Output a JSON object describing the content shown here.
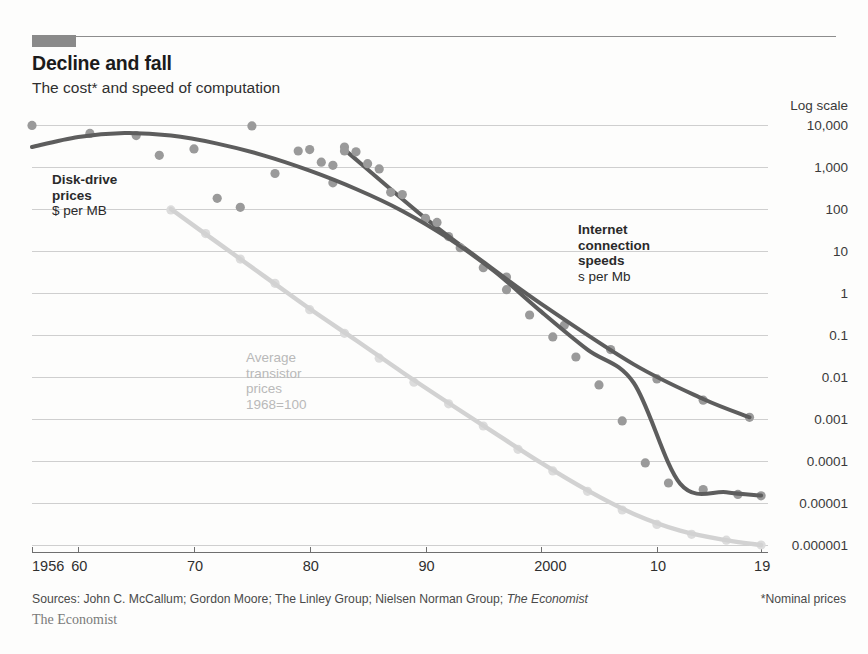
{
  "header": {
    "title": "Decline and fall",
    "subtitle": "The cost* and speed of computation",
    "accent_color": "#8a8a8a"
  },
  "footer": {
    "sources": "Sources: John C. McCallum; Gordon Moore; The Linley Group; Nielsen Norman Group; ",
    "sources_italic": "The Economist",
    "footnote": "*Nominal prices",
    "brand": "The Economist"
  },
  "annotations": {
    "disk": {
      "head": "Disk-drive\nprices",
      "head_line1": "Disk-drive",
      "head_line2": "prices",
      "unit": "$ per MB"
    },
    "internet": {
      "head_line1": "Internet",
      "head_line2": "connection",
      "head_line3": "speeds",
      "unit": "s per Mb"
    },
    "transistor": {
      "line1": "Average",
      "line2": "transistor",
      "line3": "prices",
      "line4": "1968=100"
    }
  },
  "chart_data": {
    "type": "line",
    "title": "Decline and fall",
    "subtitle": "The cost* and speed of computation",
    "xlabel": "",
    "ylabel": "",
    "scale_label": "Log scale",
    "y_axis_type": "log",
    "ylim": [
      1e-06,
      10000
    ],
    "y_ticks": [
      10000,
      1000,
      100,
      10,
      1,
      0.1,
      0.01,
      0.001,
      0.0001,
      1e-05,
      1e-06
    ],
    "y_tick_labels": [
      "10,000",
      "1,000",
      "100",
      "10",
      "1",
      "0.1",
      "0.01",
      "0.001",
      "0.0001",
      "0.00001",
      "0.000001"
    ],
    "xlim": [
      1956,
      1919
    ],
    "x_ticks": [
      1956,
      1960,
      1970,
      1980,
      1990,
      2000,
      2010,
      2019
    ],
    "x_tick_labels": [
      "1956",
      "60",
      "70",
      "80",
      "90",
      "2000",
      "10",
      "19"
    ],
    "grid": true,
    "legend_position": "inline-annotations",
    "series": [
      {
        "name": "Disk-drive prices",
        "unit": "$ per MB",
        "color": "#5d5d5d",
        "point_color": "#9a9a9a",
        "trend": [
          [
            1956,
            3000
          ],
          [
            1960,
            5200
          ],
          [
            1964,
            6400
          ],
          [
            1968,
            5600
          ],
          [
            1972,
            3600
          ],
          [
            1976,
            1900
          ],
          [
            1980,
            820
          ],
          [
            1984,
            300
          ],
          [
            1988,
            90
          ],
          [
            1992,
            20
          ],
          [
            1996,
            3.2
          ],
          [
            2000,
            0.36
          ],
          [
            2004,
            0.045
          ],
          [
            2008,
            0.0072
          ],
          [
            2012,
            2.9e-05
          ],
          [
            2016,
            1.8e-05
          ],
          [
            2019,
            1.5e-05
          ]
        ],
        "points": [
          [
            1956,
            9800
          ],
          [
            1961,
            6300
          ],
          [
            1965,
            5600
          ],
          [
            1967,
            1900
          ],
          [
            1970,
            2700
          ],
          [
            1972,
            180
          ],
          [
            1974,
            110
          ],
          [
            1975,
            9500
          ],
          [
            1977,
            700
          ],
          [
            1979,
            2400
          ],
          [
            1980,
            2600
          ],
          [
            1981,
            1300
          ],
          [
            1982,
            1100
          ],
          [
            1982,
            420
          ],
          [
            1983,
            2400
          ],
          [
            1984,
            2300
          ],
          [
            1985,
            1200
          ],
          [
            1986,
            900
          ],
          [
            1987,
            250
          ],
          [
            1988,
            220
          ],
          [
            1990,
            60
          ],
          [
            1991,
            48
          ],
          [
            1993,
            12
          ],
          [
            1995,
            4.0
          ],
          [
            1997,
            1.2
          ],
          [
            1999,
            0.3
          ],
          [
            2001,
            0.09
          ],
          [
            2003,
            0.03
          ],
          [
            2005,
            0.0065
          ],
          [
            2007,
            0.0009
          ],
          [
            2009,
            9e-05
          ],
          [
            2011,
            3e-05
          ],
          [
            2014,
            2.1e-05
          ],
          [
            2017,
            1.6e-05
          ],
          [
            2019,
            1.48e-05
          ]
        ]
      },
      {
        "name": "Internet connection speeds",
        "unit": "s per Mb",
        "color": "#5d5d5d",
        "point_color": "#9a9a9a",
        "trend": [
          [
            1983,
            2600
          ],
          [
            1990,
            60
          ],
          [
            1995,
            5.5
          ],
          [
            2000,
            0.55
          ],
          [
            2008,
            0.02
          ],
          [
            2014,
            0.003
          ],
          [
            2018,
            0.0011
          ]
        ],
        "points": [
          [
            1983,
            3000
          ],
          [
            1992,
            22
          ],
          [
            1997,
            2.4
          ],
          [
            2002,
            0.17
          ],
          [
            2006,
            0.045
          ],
          [
            2010,
            0.009
          ],
          [
            2014,
            0.0028
          ],
          [
            2018,
            0.0011
          ]
        ]
      },
      {
        "name": "Average transistor prices",
        "unit": "1968=100",
        "color": "#d2d2d2",
        "point_color": "#dcdcdc",
        "trend": [
          [
            1968,
            100
          ],
          [
            1972,
            16
          ],
          [
            1976,
            2.6
          ],
          [
            1980,
            0.42
          ],
          [
            1984,
            0.075
          ],
          [
            1988,
            0.013
          ],
          [
            1992,
            0.0024
          ],
          [
            1996,
            0.00046
          ],
          [
            2000,
            9e-05
          ],
          [
            2004,
            2e-05
          ],
          [
            2008,
            5.5e-06
          ],
          [
            2012,
            2.2e-06
          ],
          [
            2016,
            1.3e-06
          ],
          [
            2019,
            1e-06
          ]
        ],
        "points": [
          [
            1968,
            95
          ],
          [
            1971,
            26
          ],
          [
            1974,
            6.4
          ],
          [
            1977,
            1.7
          ],
          [
            1980,
            0.4
          ],
          [
            1983,
            0.11
          ],
          [
            1986,
            0.028
          ],
          [
            1989,
            0.0075
          ],
          [
            1992,
            0.0023
          ],
          [
            1995,
            0.00068
          ],
          [
            1998,
            0.00019
          ],
          [
            2001,
            5.8e-05
          ],
          [
            2004,
            1.9e-05
          ],
          [
            2007,
            6.8e-06
          ],
          [
            2010,
            3.1e-06
          ],
          [
            2013,
            1.8e-06
          ],
          [
            2016,
            1.3e-06
          ],
          [
            2019,
            1e-06
          ]
        ]
      }
    ]
  }
}
